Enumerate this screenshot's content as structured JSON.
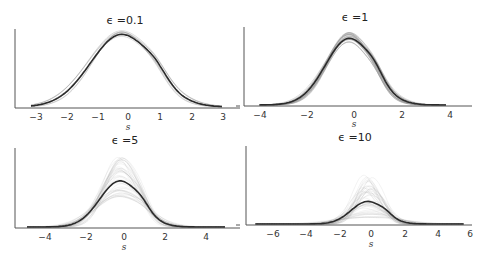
{
  "chart_data": [
    {
      "type": "line",
      "title": "ϵ =0.1",
      "xlabel": "s",
      "ylabel": "",
      "xticks": [
        -3,
        -2,
        -1,
        0,
        1,
        2,
        3
      ],
      "xlim": [
        -3.3,
        3.5
      ],
      "description": "Density estimates of s; many faint sample curves nearly coincide with bold mean curve",
      "series": [
        {
          "name": "mean density",
          "style": "bold dark",
          "peak_x": -0.2,
          "peak_rel_height": 1.0,
          "spread": 1.0
        },
        {
          "name": "sample densities",
          "style": "faint gray",
          "spread_of_peaks": "very small"
        }
      ]
    },
    {
      "type": "line",
      "title": "ϵ =1",
      "xlabel": "s",
      "ylabel": "",
      "xticks": [
        -4,
        -2,
        0,
        2,
        4
      ],
      "xlim": [
        -4.6,
        5.0
      ],
      "description": "Density estimates of s; faint sample curves slightly dispersed around bold mean curve",
      "series": [
        {
          "name": "mean density",
          "style": "bold dark",
          "peak_x": -0.2,
          "peak_rel_height": 0.86,
          "spread": 1.0
        },
        {
          "name": "sample densities",
          "style": "faint gray",
          "spread_of_peaks": "small"
        }
      ]
    },
    {
      "type": "line",
      "title": "ϵ =5",
      "xlabel": "s",
      "ylabel": "",
      "xticks": [
        -4,
        -2,
        0,
        2,
        4
      ],
      "xlim": [
        -5.2,
        5.6
      ],
      "description": "Density estimates of s; faint sample curves widely dispersed, peaks up to ~1.6x mean peak",
      "series": [
        {
          "name": "mean density",
          "style": "bold dark",
          "peak_x": -0.2,
          "peak_rel_height": 0.6,
          "spread": 1.0
        },
        {
          "name": "sample densities",
          "style": "faint gray",
          "spread_of_peaks": "moderate"
        }
      ]
    },
    {
      "type": "line",
      "title": "ϵ =10",
      "xlabel": "s",
      "ylabel": "",
      "xticks": [
        -6,
        -4,
        -2,
        0,
        2,
        4,
        6
      ],
      "xlim": [
        -7.6,
        6.0
      ],
      "description": "Density estimates of s; faint sample curves highly dispersed, peaks up to ~3x mean peak",
      "series": [
        {
          "name": "mean density",
          "style": "bold dark",
          "peak_x": -0.2,
          "peak_rel_height": 0.3,
          "spread": 1.0
        },
        {
          "name": "sample densities",
          "style": "faint gray",
          "spread_of_peaks": "large"
        }
      ]
    }
  ],
  "panels": [
    {
      "title": "ϵ =0.1",
      "xlabel": "s",
      "ticks": [
        "−3",
        "−2",
        "−1",
        "0",
        "1",
        "2",
        "3"
      ]
    },
    {
      "title": "ϵ =1",
      "xlabel": "s",
      "ticks": [
        "−4",
        "−2",
        "0",
        "2",
        "4"
      ]
    },
    {
      "title": "ϵ =5",
      "xlabel": "s",
      "ticks": [
        "−4",
        "−2",
        "0",
        "2",
        "4"
      ]
    },
    {
      "title": "ϵ =10",
      "xlabel": "s",
      "ticks": [
        "−6",
        "−4",
        "−2",
        "0",
        "2",
        "4",
        "6"
      ]
    }
  ],
  "colors": {
    "mean_line": "#2b2b2b",
    "sample_lines": "#9a9a9a",
    "axis": "#555555"
  }
}
